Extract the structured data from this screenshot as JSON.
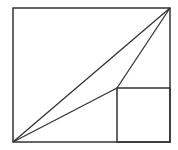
{
  "diagram": {
    "width": 178,
    "height": 150,
    "stroke_color": "#333333",
    "background": "#ffffff",
    "outer_rect": {
      "x": 13,
      "y": 8,
      "w": 157,
      "h": 134
    },
    "inner_square": {
      "x": 117,
      "y": 88,
      "w": 53,
      "h": 54
    },
    "segments": [
      {
        "name": "diagonal",
        "x1": 13,
        "y1": 142,
        "x2": 170,
        "y2": 8
      },
      {
        "name": "lower-triangle-edge",
        "x1": 13,
        "y1": 142,
        "x2": 117,
        "y2": 88
      },
      {
        "name": "upper-triangle-edge",
        "x1": 117,
        "y1": 88,
        "x2": 170,
        "y2": 8
      }
    ]
  }
}
